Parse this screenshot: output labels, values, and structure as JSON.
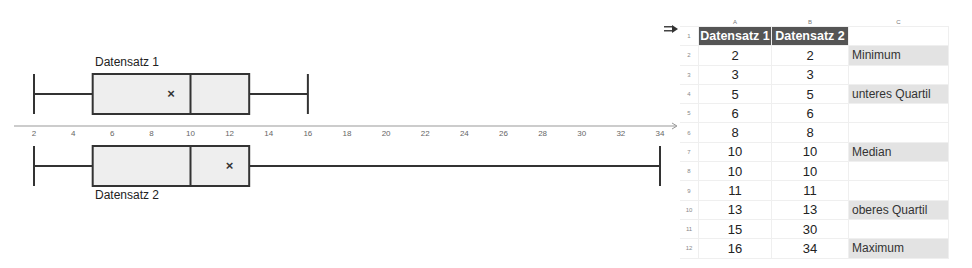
{
  "chart_data": {
    "type": "boxplot",
    "title": "",
    "xlabel": "",
    "ylabel": "",
    "xlim": [
      2,
      34
    ],
    "x_ticks": [
      2,
      4,
      6,
      8,
      10,
      12,
      14,
      16,
      18,
      20,
      22,
      24,
      26,
      28,
      30,
      32,
      34
    ],
    "grid": false,
    "series": [
      {
        "name": "Datensatz 1",
        "min": 2,
        "q1": 5,
        "median": 10,
        "q3": 13,
        "max": 16,
        "mean": 9,
        "values": [
          2,
          3,
          5,
          6,
          8,
          10,
          10,
          11,
          13,
          15,
          16
        ]
      },
      {
        "name": "Datensatz 2",
        "min": 2,
        "q1": 5,
        "median": 10,
        "q3": 13,
        "max": 34,
        "mean": 12,
        "values": [
          2,
          3,
          5,
          6,
          8,
          10,
          10,
          11,
          13,
          30,
          34
        ]
      }
    ],
    "colors": {
      "box_fill": "#eeeeee",
      "stroke": "#333333",
      "axis": "#999999"
    }
  },
  "plot": {
    "label_1": "Datensatz 1",
    "label_2": "Datensatz 2",
    "mean_marker": "×"
  },
  "sheet": {
    "columns": [
      "A",
      "B",
      "C"
    ],
    "rows": [
      {
        "n": "1",
        "a": "Datensatz 1",
        "b": "Datensatz 2",
        "c": ""
      },
      {
        "n": "2",
        "a": "2",
        "b": "2",
        "c": "Minimum"
      },
      {
        "n": "3",
        "a": "3",
        "b": "3",
        "c": ""
      },
      {
        "n": "4",
        "a": "5",
        "b": "5",
        "c": "unteres Quartil"
      },
      {
        "n": "5",
        "a": "6",
        "b": "6",
        "c": ""
      },
      {
        "n": "6",
        "a": "8",
        "b": "8",
        "c": ""
      },
      {
        "n": "7",
        "a": "10",
        "b": "10",
        "c": "Median"
      },
      {
        "n": "8",
        "a": "10",
        "b": "10",
        "c": ""
      },
      {
        "n": "9",
        "a": "11",
        "b": "11",
        "c": ""
      },
      {
        "n": "10",
        "a": "13",
        "b": "13",
        "c": "oberes Quartil"
      },
      {
        "n": "11",
        "a": "15",
        "b": "30",
        "c": ""
      },
      {
        "n": "12",
        "a": "16",
        "b": "34",
        "c": "Maximum"
      }
    ]
  }
}
